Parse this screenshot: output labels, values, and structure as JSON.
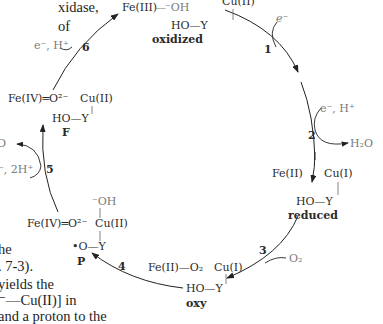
{
  "figure": {
    "cycle_title": "Cytochrome c oxidase catalytic cycle",
    "states": {
      "oxidized": {
        "fe": "Fe(III)",
        "bond": "—",
        "ligand": "⁻OH",
        "cu": "Cu(II)",
        "tyr": "HO—Y",
        "label": "oxidized"
      },
      "reduced": {
        "fe": "Fe(II)",
        "cu": "Cu(I)",
        "tyr": "HO—Y",
        "label": "reduced"
      },
      "oxy": {
        "fe": "Fe(II)—O₂",
        "cu": "Cu(I)",
        "tyr": "HO—Y",
        "label": "oxy"
      },
      "P": {
        "fe": "Fe(IV)═O²⁻",
        "cu_ligand": "⁻OH",
        "cu": "Cu(II)",
        "tyr": "•O—Y",
        "label": "P"
      },
      "F": {
        "fe": "Fe(IV)═O²⁻",
        "cu": "Cu(II)",
        "tyr": "HO—Y",
        "label": "F"
      }
    },
    "steps": [
      {
        "number": "1",
        "input": "e⁻"
      },
      {
        "number": "2",
        "input": "e⁻, H⁺",
        "output": "H₂O"
      },
      {
        "number": "3",
        "input": "O₂"
      },
      {
        "number": "4"
      },
      {
        "number": "5",
        "input": "⁻, 2H⁺",
        "output": "O"
      },
      {
        "number": "6",
        "input": "e⁻, H⁺"
      }
    ]
  },
  "paragraph_fragments": {
    "top": [
      "xidase,",
      "of"
    ],
    "bottom": [
      "he",
      ". 7-3).",
      "yields the",
      "⁻—Cu(II)]  in",
      "and a proton to the"
    ]
  }
}
